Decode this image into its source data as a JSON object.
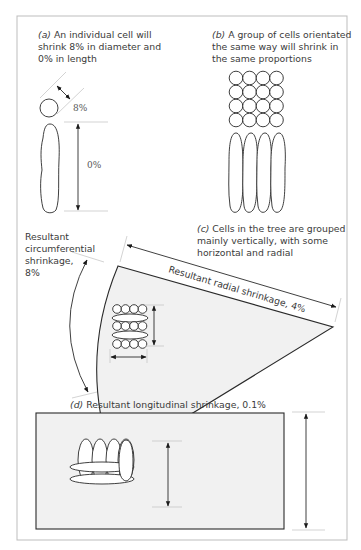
{
  "figure": {
    "panel_a": {
      "label": "(a)",
      "text_lines": [
        "An individual cell will",
        "shrink 8% in diameter and",
        "0% in length"
      ],
      "diameter_shrinkage": "8%",
      "length_shrinkage": "0%"
    },
    "panel_b": {
      "label": "(b)",
      "text_lines": [
        "A group of cells orientated",
        "the same way will shrink in",
        "the same proportions"
      ]
    },
    "panel_c": {
      "label": "(c)",
      "text_lines": [
        "Cells in the tree are grouped",
        "mainly vertically, with some",
        "horizontal and radial"
      ],
      "circumferential_label_lines": [
        "Resultant",
        "circumferential",
        "shrinkage,",
        "8%"
      ],
      "radial_label": "Resultant radial shrinkage, 4%"
    },
    "panel_d": {
      "label": "(d)",
      "text": "Resultant longitudinal shrinkage, 0.1%"
    },
    "colors": {
      "line": "#2a2a2a",
      "text": "#3a3a3a",
      "wood_fill": "#f1f1f1",
      "frame": "#bdbdbd"
    }
  }
}
